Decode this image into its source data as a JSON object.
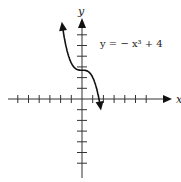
{
  "chart_data": {
    "type": "line",
    "title": "",
    "equation_label": "y = − x³ + 4",
    "xlabel": "x",
    "ylabel": "y",
    "function": "y = -x^3 + 4",
    "xlim": [
      -7,
      8
    ],
    "ylim": [
      -7,
      8
    ],
    "grid": false,
    "legend": "none",
    "x_tick_spacing": 1,
    "y_tick_spacing": 1,
    "x_ticks": [
      -6,
      -5,
      -4,
      -3,
      -2,
      -1,
      1,
      2,
      3,
      4,
      5,
      6
    ],
    "y_ticks": [
      -6,
      -5,
      -4,
      -3,
      -2,
      -1,
      1,
      2,
      3,
      4,
      5,
      6
    ],
    "series": [
      {
        "name": "y = -x^3 + 4",
        "x": [
          -2.2,
          -2,
          -1.5,
          -1,
          -0.5,
          0,
          0.5,
          1,
          1.5,
          1.71,
          2,
          2.2
        ],
        "y": [
          14.6,
          12,
          7.4,
          5,
          4.1,
          4,
          3.9,
          3,
          0.6,
          0,
          -4,
          -6.6
        ]
      }
    ],
    "key_points": {
      "y_intercept": [
        0,
        4
      ],
      "x_intercept": [
        1.59,
        0
      ]
    },
    "colors": {
      "axis": "#333333",
      "curve": "#111111"
    }
  }
}
